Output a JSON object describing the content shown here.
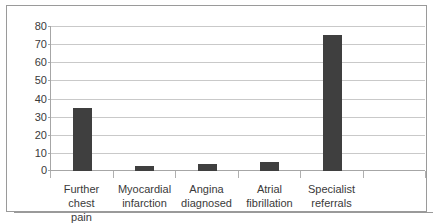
{
  "chart_data": {
    "type": "bar",
    "title": "",
    "subtitle": "",
    "xlabel": "",
    "ylabel": "",
    "categories": [
      "Further chest pain",
      "Myocardial infarction",
      "Angina diagnosed",
      "Atrial fibrillation",
      "Specialist referrals",
      ""
    ],
    "values": [
      35,
      3,
      4,
      5,
      75,
      null
    ],
    "ylim": [
      0,
      80
    ],
    "ytick_step": 10,
    "yticks": [
      0,
      10,
      20,
      30,
      40,
      50,
      60,
      70,
      80
    ],
    "ytick_labels": [
      "0",
      "10",
      "20",
      "30",
      "40",
      "50",
      "60",
      "70",
      "80"
    ],
    "grid": true,
    "grid_axis": "y",
    "legend": false,
    "legend_position": "none",
    "series": [
      {
        "name": "",
        "values": [
          35,
          3,
          4,
          5,
          75,
          null
        ],
        "color": "#3f3f3f"
      }
    ]
  },
  "axis": {
    "y_labels": [
      "80",
      "70",
      "60",
      "50",
      "40",
      "30",
      "20",
      "10",
      "0"
    ],
    "x_labels": [
      {
        "line1": "Further chest",
        "line2": "pain"
      },
      {
        "line1": "Myocardial",
        "line2": "infarction"
      },
      {
        "line1": "Angina",
        "line2": "diagnosed"
      },
      {
        "line1": "Atrial",
        "line2": "fibrillation"
      },
      {
        "line1": "Specialist",
        "line2": "referrals"
      },
      {
        "line1": "",
        "line2": ""
      }
    ]
  },
  "colors": {
    "bar": "#3f3f3f",
    "gridline": "#c9c9c9",
    "axis": "#a6a6a6",
    "frame": "#9a9a9a",
    "text": "#3a3a3a",
    "background": "#ffffff"
  }
}
